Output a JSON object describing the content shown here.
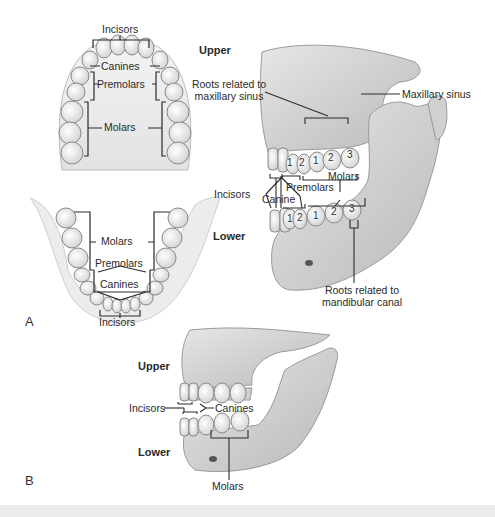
{
  "figure": {
    "panels": [
      {
        "id": "A",
        "label": "A",
        "upper_arch": {
          "labels": {
            "incisors": "Incisors",
            "canines": "Canines",
            "premolars": "Premolars",
            "molars": "Molars"
          }
        },
        "lower_arch": {
          "labels": {
            "molars": "Molars",
            "premolars": "Premolars",
            "canines": "Canines",
            "incisors": "Incisors"
          }
        },
        "lateral_view": {
          "upper_label": "Upper",
          "lower_label": "Lower",
          "roots_maxillary": "Roots related to maxillary sinus",
          "roots_maxillary_line1": "Roots related to",
          "roots_maxillary_line2": "maxillary sinus",
          "maxillary_sinus": "Maxillary sinus",
          "incisors": "Incisors",
          "canine": "Canine",
          "premolars": "Premolars",
          "molars": "Molars",
          "roots_mandibular_line1": "Roots related to",
          "roots_mandibular_line2": "mandibular canal",
          "upper_tooth_numbers": [
            "1",
            "2",
            "1",
            "2",
            "3"
          ],
          "lower_tooth_numbers": [
            "1",
            "2",
            "1",
            "2",
            "3"
          ]
        }
      },
      {
        "id": "B",
        "label": "B",
        "upper_label": "Upper",
        "lower_label": "Lower",
        "incisors": "Incisors",
        "canines": "Canines",
        "molars": "Molars"
      }
    ]
  },
  "colors": {
    "bone": "#d9d9d9",
    "bone_shadow": "#a8a8a8",
    "tooth": "#f2f2f2",
    "line": "#2a2a2a",
    "footer": "#ebebeb"
  }
}
